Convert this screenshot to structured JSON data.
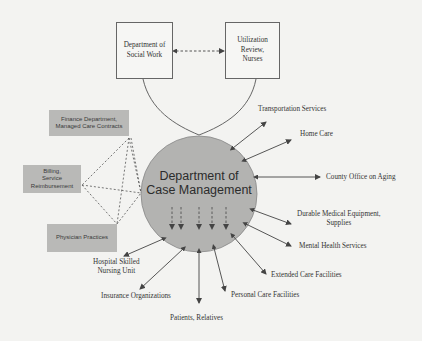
{
  "diagram": {
    "center": {
      "line1": "Department of",
      "line2": "Case Management",
      "fill": "#b3b3b1"
    },
    "top_boxes": [
      {
        "id": "social-work",
        "lines": [
          "Department of",
          "Social Work"
        ]
      },
      {
        "id": "utilization",
        "lines": [
          "Utilization",
          "Review,",
          "Nurses"
        ]
      }
    ],
    "left_boxes": [
      {
        "id": "finance",
        "lines": [
          "Finance Department,",
          "Managed Care Contracts"
        ]
      },
      {
        "id": "billing",
        "lines": [
          "Billing,",
          "Service",
          "Reimbursement"
        ]
      },
      {
        "id": "physician",
        "lines": [
          "Physician Practices"
        ]
      }
    ],
    "outer_nodes": [
      {
        "id": "transportation",
        "lines": [
          "Transportation Services"
        ]
      },
      {
        "id": "home-care",
        "lines": [
          "Home Care"
        ]
      },
      {
        "id": "county-office",
        "lines": [
          "County Office on Aging"
        ]
      },
      {
        "id": "dme",
        "lines": [
          "Durable Medical Equipment,",
          "Supplies"
        ]
      },
      {
        "id": "mental-health",
        "lines": [
          "Mental Health Services"
        ]
      },
      {
        "id": "extended-care",
        "lines": [
          "Extended Care Facilities"
        ]
      },
      {
        "id": "personal-care",
        "lines": [
          "Personal Care Facilities"
        ]
      },
      {
        "id": "patients",
        "lines": [
          "Patients,  Relatives"
        ]
      },
      {
        "id": "insurance",
        "lines": [
          "Insurance Organizations"
        ]
      },
      {
        "id": "hospital-snu",
        "lines": [
          "Hospital Skilled",
          "Nursing Unit"
        ]
      }
    ],
    "colors": {
      "background": "#f3f3f1",
      "line": "#555555",
      "gray_box": "#b9b9b7",
      "circle": "#b3b3b1"
    }
  }
}
